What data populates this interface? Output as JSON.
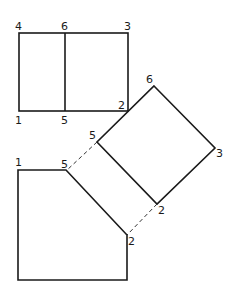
{
  "diagram": {
    "colors": {
      "line": "#1a1a1a",
      "background": "#ffffff"
    },
    "rectangle": {
      "labels": {
        "top_left": "4",
        "top_mid": "6",
        "top_right": "3",
        "bottom_left": "1",
        "bottom_mid": "5",
        "bottom_right": "2"
      }
    },
    "square": {
      "labels": {
        "top": "6",
        "right": "3",
        "bottom": "2",
        "left": "5"
      }
    },
    "pentagon": {
      "labels": {
        "top_left": "1",
        "top_right": "5",
        "right": "2"
      }
    }
  }
}
